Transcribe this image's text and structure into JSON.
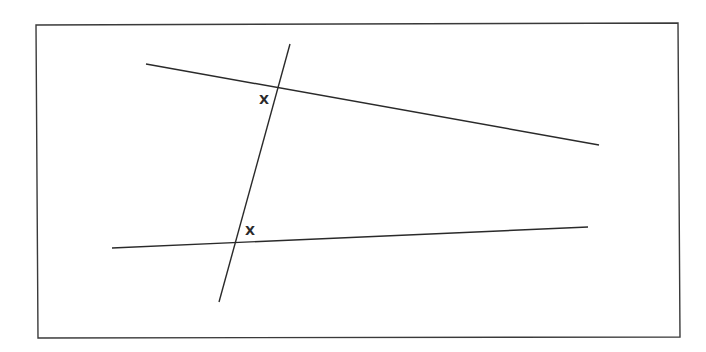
{
  "diagram": {
    "type": "geometry-parallel-lines-transversal",
    "frame": {
      "points": [
        [
          36,
          25
        ],
        [
          678,
          23
        ],
        [
          680,
          337
        ],
        [
          38,
          338
        ]
      ],
      "stroke": "#3a3a3a"
    },
    "lines": [
      {
        "id": "upper-line",
        "x1": 146,
        "y1": 64,
        "x2": 599,
        "y2": 145
      },
      {
        "id": "lower-line",
        "x1": 112,
        "y1": 248,
        "x2": 588,
        "y2": 227
      },
      {
        "id": "transversal",
        "x1": 290,
        "y1": 44,
        "x2": 219,
        "y2": 302
      }
    ],
    "intersections": [
      {
        "id": "upper-intersection",
        "x": 277,
        "y": 87
      },
      {
        "id": "lower-intersection",
        "x": 235,
        "y": 242
      }
    ],
    "labels": [
      {
        "id": "upper-angle-label",
        "text": "X",
        "x": 259,
        "y": 104
      },
      {
        "id": "lower-angle-label",
        "text": "X",
        "x": 245,
        "y": 235
      }
    ],
    "line_color": "#2a2a2a"
  }
}
